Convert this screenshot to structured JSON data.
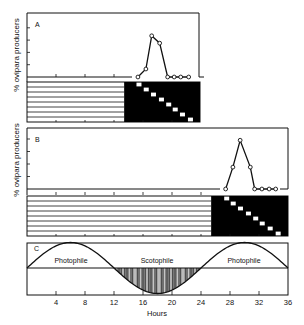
{
  "figure": {
    "panels": [
      {
        "id": "A",
        "label": "A",
        "ylabel": "% ovipara producers"
      },
      {
        "id": "B",
        "label": "B",
        "ylabel": "% ovipara producers"
      },
      {
        "id": "C",
        "label": "C",
        "regions": [
          "Photophile",
          "Scotophile",
          "Photophile"
        ]
      }
    ],
    "xlabel": "Hours",
    "xticks": [
      4,
      8,
      12,
      16,
      20,
      24,
      28,
      32,
      36
    ]
  },
  "chart_data": [
    {
      "type": "line",
      "title": "A",
      "xlabel": "Hours",
      "ylabel": "% ovipara producers",
      "xlim": [
        0,
        24
      ],
      "yticks_labeled": false,
      "x": [
        15.3,
        16.4,
        17.2,
        18.3,
        19.4,
        20.3,
        21.2,
        22.3
      ],
      "values": [
        0,
        13,
        67,
        55,
        0,
        0,
        0,
        0
      ],
      "light_schedule": {
        "rows": 8,
        "dark_start_hour": 13.4,
        "dark_end_hour": 24,
        "light_break_hours": [
          15.1,
          16.1,
          17.1,
          18.2,
          19.2,
          20.1,
          21.1,
          22.2
        ]
      }
    },
    {
      "type": "line",
      "title": "B",
      "xlabel": "Hours",
      "ylabel": "% ovipara producers",
      "xlim": [
        0,
        36
      ],
      "yticks_labeled": false,
      "x": [
        27.4,
        28.4,
        29.4,
        30.8,
        31.4,
        32.4,
        33.4,
        34.3
      ],
      "values": [
        0,
        35,
        78,
        35,
        0,
        0,
        0,
        0
      ],
      "light_schedule": {
        "rows": 8,
        "dark_start_hour": 25.4,
        "dark_end_hour": 36,
        "light_break_hours": [
          27.2,
          28.1,
          29.1,
          30.2,
          31.2,
          32.1,
          33.2,
          34.3
        ]
      }
    },
    {
      "type": "line",
      "title": "C",
      "xlabel": "Hours",
      "xlim": [
        0,
        36
      ],
      "curve": "sine, period 24 h, zero-crossings at 0, 12, 24, 36; peaks at 6 and 30; trough at 18",
      "regions": [
        {
          "name": "Photophile",
          "from": 0,
          "to": 12
        },
        {
          "name": "Scotophile",
          "from": 12,
          "to": 24,
          "shaded": true
        },
        {
          "name": "Photophile",
          "from": 24,
          "to": 36
        }
      ],
      "xticks": [
        4,
        8,
        12,
        16,
        20,
        24,
        28,
        32,
        36
      ]
    }
  ]
}
